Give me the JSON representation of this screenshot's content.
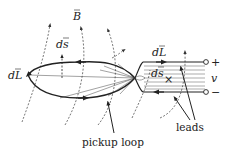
{
  "figure": {
    "labels": {
      "field_vector": "B",
      "area_element_loop": "ds",
      "line_element_left": "dL",
      "line_element_leads": "dL",
      "area_element_leads": "ds",
      "into_page_marker": "×",
      "voltage": "v",
      "terminal_positive": "+",
      "terminal_negative": "−"
    },
    "captions": {
      "pickup_loop": "pickup loop",
      "leads": "leads"
    },
    "colors": {
      "line": "#222222",
      "field_line": "#555555",
      "background": "#ffffff"
    }
  }
}
